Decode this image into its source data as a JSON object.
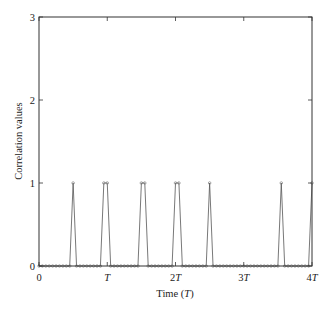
{
  "chart_data": {
    "type": "line",
    "title": "",
    "xlabel": "Time (T)",
    "ylabel": "Correlation values",
    "xlim": [
      0,
      4
    ],
    "ylim": [
      0,
      3
    ],
    "grid": false,
    "legend": null,
    "x_ticks": [
      0,
      1,
      2,
      3,
      4
    ],
    "x_tick_labels": [
      "0",
      "T",
      "2T",
      "3T",
      "4T"
    ],
    "y_ticks": [
      0,
      1,
      2,
      3
    ],
    "y_tick_labels": [
      "0",
      "1",
      "2",
      "3"
    ],
    "samples_per_T": 20,
    "marker": "circle",
    "series": [
      {
        "name": "Correlation",
        "baseline": 0,
        "peaks": [
          {
            "x": 0.5,
            "y": 1
          },
          {
            "x": 0.95,
            "y": 1
          },
          {
            "x": 1.0,
            "y": 1
          },
          {
            "x": 1.5,
            "y": 1
          },
          {
            "x": 1.55,
            "y": 1
          },
          {
            "x": 2.0,
            "y": 1
          },
          {
            "x": 2.05,
            "y": 1
          },
          {
            "x": 2.5,
            "y": 1
          },
          {
            "x": 3.55,
            "y": 1
          },
          {
            "x": 4.0,
            "y": 1
          }
        ]
      }
    ]
  },
  "labels": {
    "xlabel_prefix": "Time (",
    "xlabel_var": "T",
    "xlabel_suffix": ")",
    "ylabel": "Correlation values"
  },
  "colors": {
    "line": "#555555",
    "marker": "#777777",
    "axes": "#333333"
  }
}
